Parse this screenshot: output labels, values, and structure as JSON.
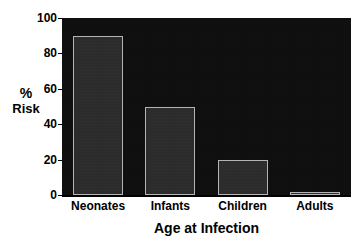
{
  "chart_data": {
    "type": "bar",
    "title": "",
    "categories": [
      "Neonates",
      "Infants",
      "Children",
      "Adults"
    ],
    "values": [
      90,
      50,
      20,
      1
    ],
    "xlabel": "Age at Infection",
    "ylabel": "% Risk",
    "ylabel_lines": [
      "%",
      "Risk"
    ],
    "ylim": [
      0,
      100
    ],
    "yticks": [
      0,
      20,
      40,
      60,
      80,
      100
    ],
    "ytick_labels": [
      "0",
      "20",
      "40",
      "60",
      "80",
      "100"
    ],
    "grid": false,
    "legend": null,
    "colors": {
      "plot_background": "#0c0c0c",
      "bar_fill": "#262626",
      "bar_edge": "#b4b4b4",
      "axis": "#000000",
      "text": "#000000",
      "page_background": "#ffffff"
    }
  }
}
